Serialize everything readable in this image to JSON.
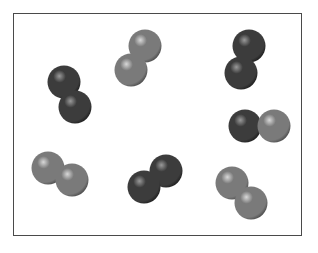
{
  "diagram": {
    "type": "particle-model",
    "frame": {
      "x": 13,
      "y": 13,
      "width": 289,
      "height": 223,
      "border_color": "#4a4a4a"
    },
    "colors": {
      "dark": {
        "base": "#3c3c3c",
        "highlight": "#9a9a9a",
        "edge": "#202020"
      },
      "light": {
        "base": "#7a7a7a",
        "highlight": "#d8d8d8",
        "edge": "#4e4e4e"
      }
    },
    "sphere_radius": 16.5,
    "molecules": [
      {
        "id": "molecule-1",
        "kind": "dark-dark",
        "atoms": [
          {
            "cx": 64,
            "cy": 82,
            "color": "dark"
          },
          {
            "cx": 75,
            "cy": 107,
            "color": "dark"
          }
        ]
      },
      {
        "id": "molecule-2",
        "kind": "light-light",
        "atoms": [
          {
            "cx": 145,
            "cy": 46,
            "color": "light"
          },
          {
            "cx": 131,
            "cy": 70,
            "color": "light"
          }
        ]
      },
      {
        "id": "molecule-3",
        "kind": "dark-dark",
        "atoms": [
          {
            "cx": 249,
            "cy": 46,
            "color": "dark"
          },
          {
            "cx": 241,
            "cy": 73,
            "color": "dark"
          }
        ]
      },
      {
        "id": "molecule-4",
        "kind": "dark-light",
        "atoms": [
          {
            "cx": 245,
            "cy": 126,
            "color": "dark"
          },
          {
            "cx": 274,
            "cy": 126,
            "color": "light"
          }
        ]
      },
      {
        "id": "molecule-5",
        "kind": "light-light",
        "atoms": [
          {
            "cx": 48,
            "cy": 168,
            "color": "light"
          },
          {
            "cx": 72,
            "cy": 180,
            "color": "light"
          }
        ]
      },
      {
        "id": "molecule-6",
        "kind": "dark-dark",
        "atoms": [
          {
            "cx": 166,
            "cy": 171,
            "color": "dark"
          },
          {
            "cx": 144,
            "cy": 187,
            "color": "dark"
          }
        ]
      },
      {
        "id": "molecule-7",
        "kind": "light-light",
        "atoms": [
          {
            "cx": 232,
            "cy": 183,
            "color": "light"
          },
          {
            "cx": 251,
            "cy": 203,
            "color": "light"
          }
        ]
      }
    ]
  }
}
